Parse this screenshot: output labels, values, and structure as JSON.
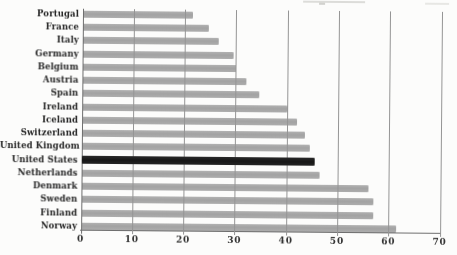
{
  "chart_data": {
    "type": "bar",
    "orientation": "horizontal",
    "categories": [
      "Portugal",
      "France",
      "Italy",
      "Germany",
      "Belgium",
      "Austria",
      "Spain",
      "Ireland",
      "Iceland",
      "Switzerland",
      "United Kingdom",
      "United States",
      "Netherlands",
      "Denmark",
      "Sweden",
      "Finland",
      "Norway"
    ],
    "values": [
      21.5,
      24.5,
      26.5,
      29.5,
      30,
      32,
      34.5,
      40,
      42,
      43.5,
      44.5,
      45.5,
      46.5,
      56,
      57,
      57,
      61.5
    ],
    "highlight": {
      "category": "United States",
      "color": "#1e1e1e"
    },
    "bar_color": "#a8a8a8",
    "xlim": [
      0,
      70
    ],
    "x_ticks": [
      0,
      10,
      20,
      30,
      40,
      50,
      60,
      70
    ],
    "gridlines": "vertical",
    "legend": "none",
    "xlabel": "",
    "ylabel": ""
  }
}
